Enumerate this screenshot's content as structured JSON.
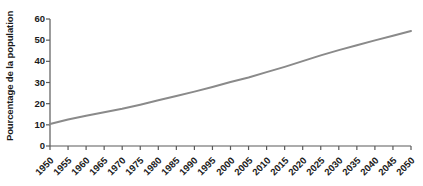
{
  "chart_data": {
    "type": "line",
    "title": "",
    "subtitle": "",
    "xlabel": "",
    "ylabel": "Pourcentage de la population",
    "xlim": [
      1950,
      2050
    ],
    "ylim": [
      0,
      60
    ],
    "grid": false,
    "legend": null,
    "x_ticks": [
      "1950",
      "1955",
      "1960",
      "1965",
      "1970",
      "1975",
      "1980",
      "1985",
      "1990",
      "1995",
      "2000",
      "2005",
      "2010",
      "2015",
      "2020",
      "2025",
      "2030",
      "2035",
      "2040",
      "2045",
      "2050"
    ],
    "y_ticks": [
      "0",
      "10",
      "20",
      "30",
      "40",
      "50",
      "60"
    ],
    "line_color": "#8a8a8a",
    "axis_color": "#5a5a5a",
    "text_color": "#1a1a1a",
    "series": [
      {
        "name": "Pourcentage de la population",
        "x": [
          1950,
          1955,
          1960,
          1965,
          1970,
          1975,
          1980,
          1985,
          1990,
          1995,
          2000,
          2005,
          2010,
          2015,
          2020,
          2025,
          2030,
          2035,
          2040,
          2045,
          2050
        ],
        "values": [
          10.4,
          12.5,
          14.3,
          15.9,
          17.6,
          19.5,
          21.6,
          23.6,
          25.7,
          27.9,
          30.2,
          32.4,
          34.9,
          37.4,
          40.1,
          42.8,
          45.3,
          47.6,
          49.9,
          52.1,
          54.3
        ]
      }
    ]
  }
}
